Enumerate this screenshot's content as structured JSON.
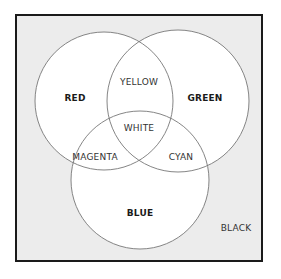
{
  "diagram": {
    "type": "venn",
    "title": "",
    "background_label": "BLACK",
    "circles": [
      {
        "name": "RED",
        "cx": 104,
        "cy": 101,
        "r": 69
      },
      {
        "name": "GREEN",
        "cx": 178,
        "cy": 101,
        "r": 71
      },
      {
        "name": "BLUE",
        "cx": 140,
        "cy": 180,
        "r": 69
      }
    ],
    "labels": {
      "red": "RED",
      "green": "GREEN",
      "blue": "BLUE",
      "yellow": "YELLOW",
      "magenta": "MAGENTA",
      "cyan": "CYAN",
      "white": "WHITE",
      "black": "BLACK"
    },
    "colors": {
      "frame_border": "#1a1a1a",
      "frame_fill": "#ececec",
      "circle_fill": "#ffffff",
      "circle_stroke": "#777777"
    }
  }
}
